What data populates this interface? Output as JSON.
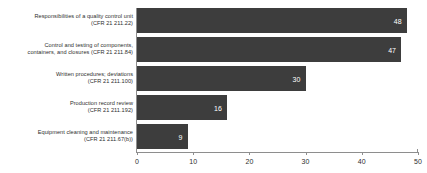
{
  "chart_data": {
    "type": "bar",
    "orientation": "horizontal",
    "title": "",
    "xlabel": "",
    "ylabel": "",
    "xlim": [
      0,
      50
    ],
    "xticks": [
      "0",
      "10",
      "20",
      "30",
      "40",
      "50"
    ],
    "grid": false,
    "legend": null,
    "bar_color": "#3d3d3d",
    "value_label_color": "#ffffff",
    "categories": [
      "Responsibilities of a quality control unit (CFR 21 211.22)",
      "Control and testing of components, containers, and closures (CFR 21 211.84)",
      "Written procedures; deviations (CFR 21 211.100)",
      "Production record review (CFR 21 211.192)",
      "Equipment cleaning and maintenance (CFR 21 211.67(b))"
    ],
    "values": [
      48,
      47,
      30,
      16,
      9
    ]
  },
  "axis": {
    "ticks": [
      {
        "label": "0",
        "value": 0
      },
      {
        "label": "10",
        "value": 10
      },
      {
        "label": "20",
        "value": 20
      },
      {
        "label": "30",
        "value": 30
      },
      {
        "label": "40",
        "value": 40
      },
      {
        "label": "50",
        "value": 50
      }
    ]
  },
  "bars": [
    {
      "label_line1": "Responsibilities of a quality control unit",
      "label_line2": "(CFR 21 211.22)",
      "value": 48,
      "value_label": "48"
    },
    {
      "label_line1": "Control and testing of components,",
      "label_line2": "containers, and closures (CFR 21 211.84)",
      "value": 47,
      "value_label": "47"
    },
    {
      "label_line1": "Written procedures; deviations",
      "label_line2": "(CFR 21 211.100)",
      "value": 30,
      "value_label": "30"
    },
    {
      "label_line1": "Production record review",
      "label_line2": "(CFR 21 211.192)",
      "value": 16,
      "value_label": "16"
    },
    {
      "label_line1": "Equipment cleaning and maintenance",
      "label_line2": "(CFR 21 211.67(b))",
      "value": 9,
      "value_label": "9"
    }
  ]
}
